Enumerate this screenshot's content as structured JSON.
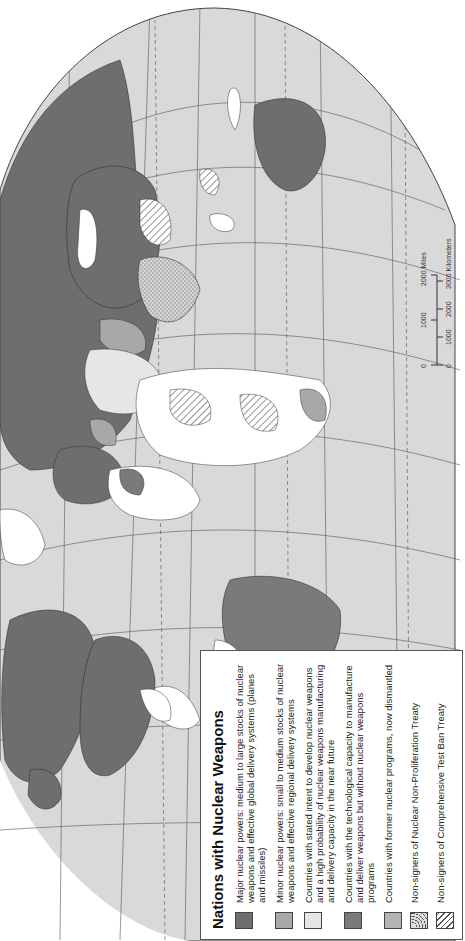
{
  "map": {
    "title": "Nations with Nuclear Weapons",
    "orientation": "rotated 90° counterclockwise",
    "colors": {
      "ocean": "#d9d9d9",
      "graticule": "#555555",
      "major_power": "#6e6e6e",
      "minor_power": "#a8a8a8",
      "stated_intent": "#e6e6e6",
      "technological_capacity": "#7a7a7a",
      "former_programs": "#b4b4b4",
      "other_land": "#ffffff"
    }
  },
  "legend": {
    "title": "Nations with Nuclear Weapons",
    "items": [
      {
        "label": "Major nuclear powers: medium to large stocks of nuclear weapons and effective global delivery systems (planes and missiles)",
        "swatch": "major_power"
      },
      {
        "label": "Minor nuclear powers: small to medium stocks of nuclear weapons and effective regional delivery systems",
        "swatch": "minor_power"
      },
      {
        "label": "Countries with stated intent to develop nuclear weapons and a high probability of nuclear weapons manufacturing and delivery capacity in the near future",
        "swatch": "stated_intent"
      },
      {
        "label": "Countries with the technological capacity to manufacture and deliver weapons but without nuclear weapons programs",
        "swatch": "technological_capacity"
      },
      {
        "label": "Countries with former nuclear programs, now dismantled",
        "swatch": "former_programs"
      },
      {
        "label": "Non-signers of Nuclear Non-Proliferation Treaty",
        "swatch": "dotted"
      },
      {
        "label": "Non-signers of Comprehensive Test Ban Treaty",
        "swatch": "hatched"
      }
    ]
  },
  "scale_bar": {
    "miles_ticks": [
      "0",
      "1000",
      "2000 Miles"
    ],
    "km_ticks": [
      "0",
      "1000",
      "2000",
      "3000 Kilometers"
    ]
  }
}
